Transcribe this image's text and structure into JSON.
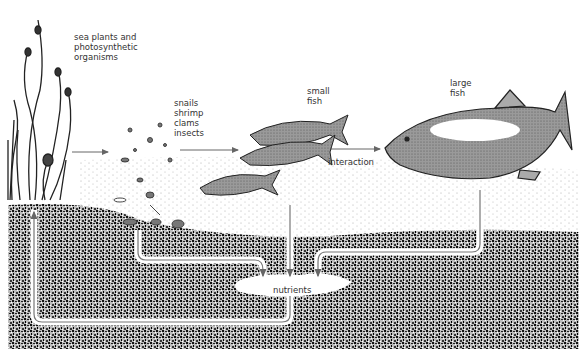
{
  "diagram": {
    "type": "food-web / nutrient cycle illustration",
    "nodes": [
      {
        "id": "plants",
        "label": "sea plants and\nphotosynthetic\norganisms"
      },
      {
        "id": "invertebrates",
        "label": "snails\nshrimp\nclams\ninsects"
      },
      {
        "id": "small_fish",
        "label": "small\nfish"
      },
      {
        "id": "large_fish",
        "label": "large\nfish"
      },
      {
        "id": "nutrients",
        "label": "nutrients"
      }
    ],
    "edges": [
      {
        "from": "plants",
        "to": "invertebrates",
        "label": ""
      },
      {
        "from": "invertebrates",
        "to": "small_fish",
        "label": ""
      },
      {
        "from": "small_fish",
        "to": "large_fish",
        "label": "interaction"
      },
      {
        "from": "invertebrates",
        "to": "nutrients",
        "label": ""
      },
      {
        "from": "small_fish",
        "to": "nutrients",
        "label": ""
      },
      {
        "from": "large_fish",
        "to": "nutrients",
        "label": ""
      },
      {
        "from": "nutrients",
        "to": "plants",
        "label": ""
      }
    ],
    "colors": {
      "sediment": "#2a2a2a",
      "arrow": "#666666",
      "fish": "#8a8a8a",
      "text": "#333333"
    }
  }
}
